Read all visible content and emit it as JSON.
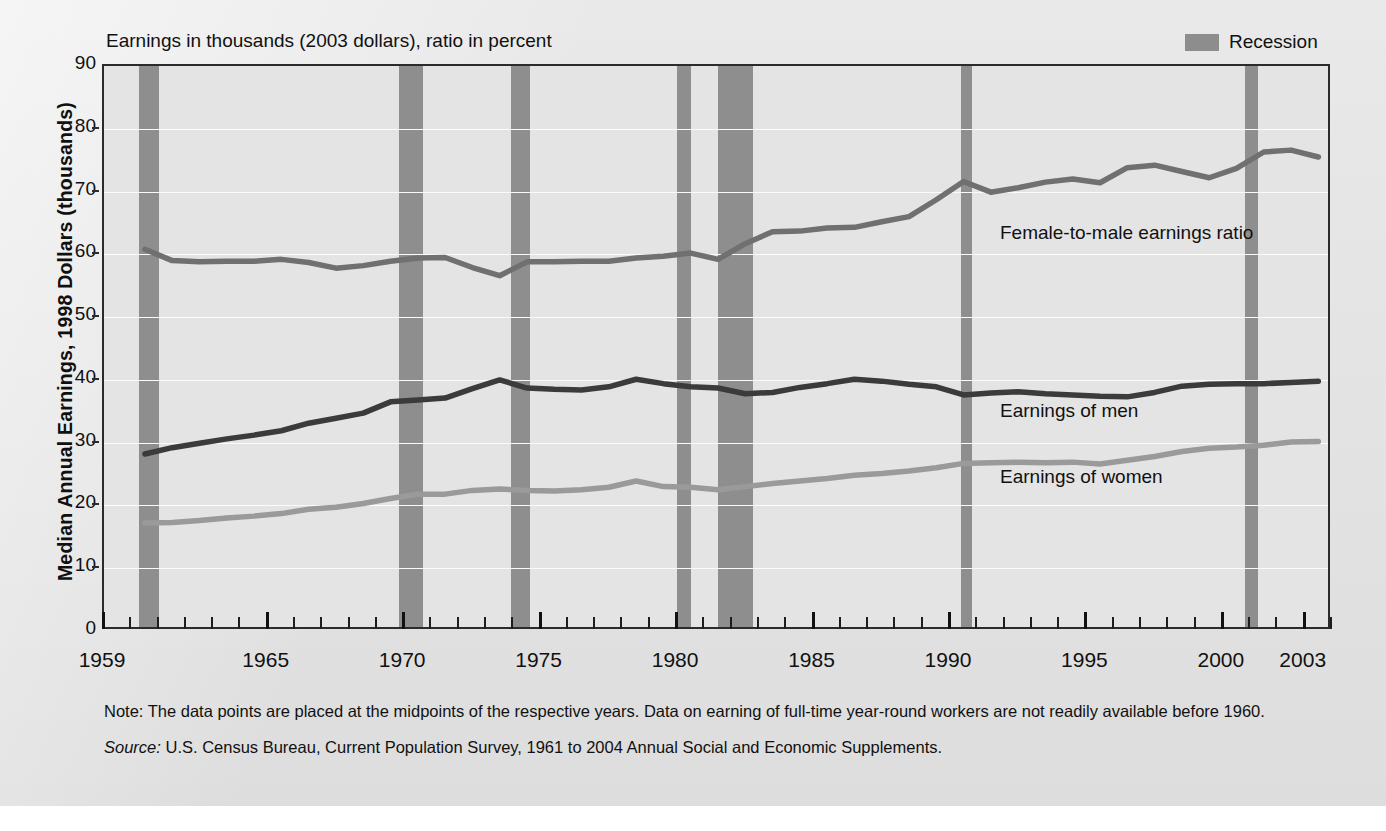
{
  "caption": "Earnings in thousands (2003 dollars), ratio in percent",
  "y_axis_title": "Median Annual Earnings, 1998 Dollars (thousands)",
  "legend": {
    "recession_label": "Recession",
    "recession_color": "#8e8e8e"
  },
  "annotations": {
    "ratio": "Female-to-male earnings ratio",
    "men": "Earnings of men",
    "women": "Earnings of women"
  },
  "notes": {
    "note": "Note: The data points are placed at the midpoints of the respective years. Data on earning of full-time year-round workers are not readily available before 1960.",
    "source_label": "Source:",
    "source_text": "U.S. Census Bureau, Current Population Survey, 1961 to 2004 Annual Social and Economic Supplements."
  },
  "colors": {
    "men_line": "#3b3b3b",
    "women_line": "#9a9a9a",
    "ratio_line": "#707070",
    "plot_bg": "#e4e4e4",
    "axis": "#2b2b2b",
    "gridline": "#fbfbfb"
  },
  "chart_data": {
    "type": "line",
    "title": "Earnings in thousands (2003 dollars), ratio in percent",
    "xlabel": "",
    "ylabel": "Median Annual Earnings, 1998 Dollars (thousands)",
    "xlim": [
      1959,
      2003
    ],
    "ylim": [
      0,
      90
    ],
    "ytick_labels": [
      0,
      10,
      20,
      30,
      40,
      50,
      60,
      70,
      80,
      90
    ],
    "xtick_labels": [
      1959,
      1965,
      1970,
      1975,
      1980,
      1985,
      1990,
      1995,
      2000,
      2003
    ],
    "grid": true,
    "legend_position": "top-right",
    "x": [
      1960,
      1961,
      1962,
      1963,
      1964,
      1965,
      1966,
      1967,
      1968,
      1969,
      1970,
      1971,
      1972,
      1973,
      1974,
      1975,
      1976,
      1977,
      1978,
      1979,
      1980,
      1981,
      1982,
      1983,
      1984,
      1985,
      1986,
      1987,
      1988,
      1989,
      1990,
      1991,
      1992,
      1993,
      1994,
      1995,
      1996,
      1997,
      1998,
      1999,
      2000,
      2001,
      2002,
      2003
    ],
    "series": [
      {
        "name": "Earnings of men",
        "color": "#3b3b3b",
        "values": [
          28.2,
          29.2,
          29.9,
          30.6,
          31.2,
          31.9,
          33.1,
          33.9,
          34.7,
          36.5,
          36.8,
          37.1,
          38.6,
          40.0,
          38.7,
          38.5,
          38.4,
          38.9,
          40.1,
          39.4,
          38.9,
          38.7,
          37.8,
          38.0,
          38.8,
          39.4,
          40.1,
          39.8,
          39.3,
          38.9,
          37.6,
          37.9,
          38.1,
          37.8,
          37.6,
          37.4,
          37.3,
          38.0,
          39.0,
          39.3,
          39.4,
          39.4,
          39.6,
          39.8
        ]
      },
      {
        "name": "Earnings of women",
        "color": "#9a9a9a",
        "values": [
          17.2,
          17.3,
          17.6,
          18.0,
          18.3,
          18.7,
          19.4,
          19.7,
          20.3,
          21.1,
          21.8,
          21.8,
          22.4,
          22.6,
          22.4,
          22.3,
          22.5,
          22.9,
          23.9,
          23.0,
          22.9,
          22.5,
          23.0,
          23.5,
          23.9,
          24.3,
          24.8,
          25.1,
          25.5,
          26.0,
          26.7,
          26.8,
          26.9,
          26.8,
          26.9,
          26.6,
          27.2,
          27.8,
          28.6,
          29.1,
          29.3,
          29.6,
          30.1,
          30.2
        ]
      },
      {
        "name": "Female-to-male earnings ratio",
        "color": "#707070",
        "values": [
          60.8,
          59.0,
          58.8,
          58.9,
          58.9,
          59.2,
          58.7,
          57.8,
          58.2,
          58.9,
          59.4,
          59.5,
          57.9,
          56.6,
          58.8,
          58.8,
          58.9,
          58.9,
          59.4,
          59.7,
          60.2,
          59.2,
          61.7,
          63.6,
          63.7,
          64.2,
          64.3,
          65.2,
          66.0,
          68.7,
          71.6,
          69.9,
          70.6,
          71.5,
          72.0,
          71.4,
          73.8,
          74.2,
          73.2,
          72.2,
          73.7,
          76.3,
          76.6,
          75.5
        ]
      }
    ],
    "recession_bands": [
      {
        "start": 1960.3,
        "end": 1961.0
      },
      {
        "start": 1969.8,
        "end": 1970.7
      },
      {
        "start": 1973.9,
        "end": 1974.6
      },
      {
        "start": 1980.0,
        "end": 1980.5
      },
      {
        "start": 1981.5,
        "end": 1982.8
      },
      {
        "start": 1990.4,
        "end": 1990.8
      },
      {
        "start": 2000.8,
        "end": 2001.3
      }
    ]
  }
}
